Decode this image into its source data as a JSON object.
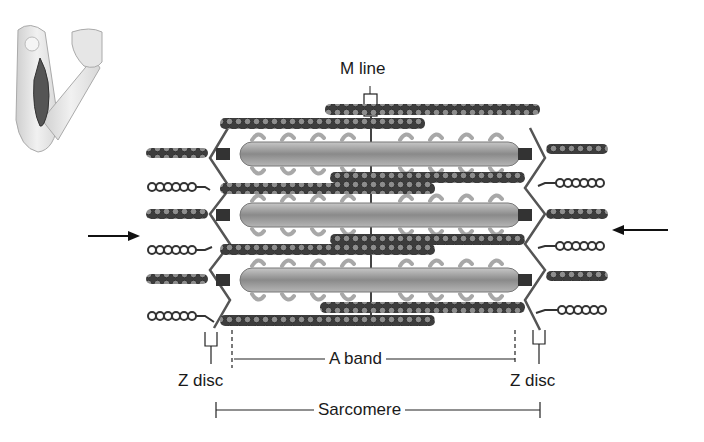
{
  "figure": {
    "labels": {
      "m_line": "M line",
      "a_band": "A band",
      "z_disc_left": "Z disc",
      "z_disc_right": "Z disc",
      "sarcomere": "Sarcomere"
    },
    "inset": "flexed-arm-biceps-icon",
    "arrows": [
      "arrow-right-icon (left side, pointing inward)",
      "arrow-left-icon (right side, pointing inward)"
    ],
    "colors": {
      "line": "#222222",
      "thick_filament": "#8a8a8a",
      "thin_filament": "#4a4a4a",
      "myosin_head": "#b0b0b0",
      "z_disc": "#555555"
    }
  }
}
